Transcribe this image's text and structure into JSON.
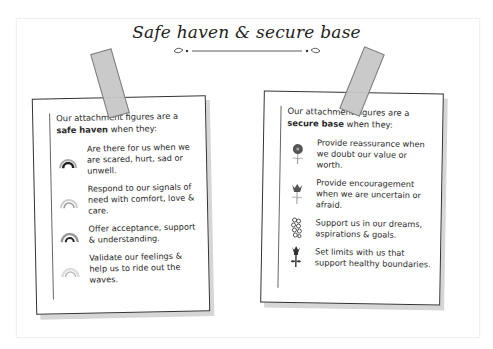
{
  "title": "Safe haven & secure base",
  "cards": {
    "left": {
      "intro_prefix": "Our attachment figures are a ",
      "intro_bold": "safe haven",
      "intro_suffix": " when they:",
      "items": [
        {
          "icon": "rainbow-dark-icon",
          "text": "Are there for us when we are scared, hurt, sad or unwell."
        },
        {
          "icon": "rainbow-light-icon",
          "text": "Respond to our signals of need with comfort, love & care."
        },
        {
          "icon": "rainbow-medium-icon",
          "text": "Offer acceptance, support & understanding."
        },
        {
          "icon": "rainbow-pale-icon",
          "text": "Validate our feelings & help us to ride out the waves."
        }
      ]
    },
    "right": {
      "intro_prefix": "Our attachment figures are a ",
      "intro_bold": "secure base",
      "intro_suffix": " when they:",
      "items": [
        {
          "icon": "flower-round-icon",
          "text": "Provide reassurance when we doubt our value or worth."
        },
        {
          "icon": "flower-tulip-icon",
          "text": "Provide encouragement when we are uncertain or afraid."
        },
        {
          "icon": "flower-cluster-icon",
          "text": "Support us in our dreams, aspirations & goals."
        },
        {
          "icon": "flower-thistle-icon",
          "text": "Set limits with us that support healthy boundaries."
        }
      ]
    }
  },
  "colors": {
    "ink": "#2a2a2a",
    "tape": "#c8c8c8",
    "shadow": "#d6d6d6"
  }
}
